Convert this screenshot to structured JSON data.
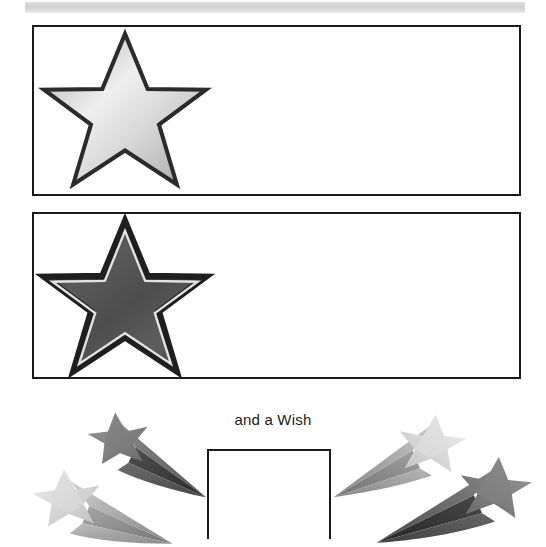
{
  "page": {
    "background_color": "#ffffff"
  },
  "top_band": {
    "name": "header-band",
    "color": "#d6d6d6"
  },
  "boxes": [
    {
      "name": "star-box-1",
      "label": "",
      "value": ""
    },
    {
      "name": "star-box-2",
      "label": "",
      "value": ""
    },
    {
      "name": "wish-box",
      "label": "",
      "value": ""
    }
  ],
  "caption": {
    "text": "and a Wish"
  },
  "icons": {
    "star_silver": "star-icon",
    "star_dark": "star-icon",
    "shooting_star": "shooting-star-icon"
  },
  "colors": {
    "frame_stroke": "#1a1a1a",
    "star_light_fill": "#cfcfcf",
    "star_light_highlight": "#f2f2f2",
    "star_dark_fill": "#4a4a4a",
    "star_dark_highlight": "#6e6e6e",
    "text": "#1c1c1c",
    "band": "#d6d6d6"
  }
}
